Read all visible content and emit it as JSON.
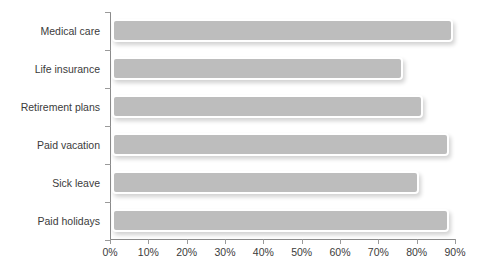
{
  "figure": {
    "caption_fragment": "",
    "background_color": "#ffffff",
    "bar_fill_color": "#bdbdbd",
    "bar_border_color": "#ffffff",
    "axis_color": "#8b8b8b",
    "text_color": "#3b3b3b"
  },
  "chart_data": {
    "type": "bar",
    "orientation": "horizontal",
    "title": "",
    "xlabel": "",
    "ylabel": "",
    "categories": [
      "Medical care",
      "Life insurance",
      "Retirement plans",
      "Paid vacation",
      "Sick leave",
      "Paid holidays"
    ],
    "values": [
      89,
      76,
      81,
      88,
      80,
      88
    ],
    "value_labels": [
      "",
      "",
      "",
      "",
      "",
      ""
    ],
    "xlim": [
      0,
      90
    ],
    "xticks": [
      0,
      10,
      20,
      30,
      40,
      50,
      60,
      70,
      80,
      90
    ],
    "xtick_labels": [
      "0%",
      "10%",
      "20%",
      "30%",
      "40%",
      "50%",
      "60%",
      "70%",
      "80%",
      "90%"
    ],
    "grid": false,
    "legend": null,
    "legend_position": "none"
  }
}
